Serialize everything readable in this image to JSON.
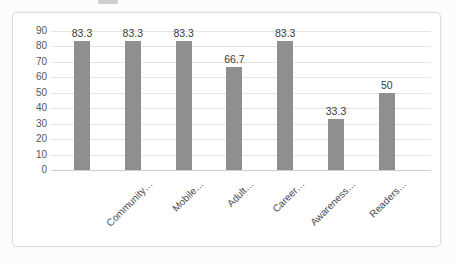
{
  "chart_data": {
    "type": "bar",
    "title": "",
    "xlabel": "",
    "ylabel": "",
    "categories": [
      "",
      "Community…",
      "Mobile…",
      "Adult…",
      "Career…",
      "Awareness…",
      "Readers…"
    ],
    "values": [
      83.3,
      83.3,
      83.3,
      66.7,
      83.3,
      33.3,
      50
    ],
    "data_labels": [
      "83.3",
      "83.3",
      "83.3",
      "66.7",
      "83.3",
      "33.3",
      "50"
    ],
    "ylim": [
      0,
      90
    ],
    "ytick_step": 10,
    "ytick_labels": [
      "0",
      "10",
      "20",
      "30",
      "40",
      "50",
      "60",
      "70",
      "80",
      "90"
    ],
    "grid": true,
    "legend": false,
    "series_name": "",
    "bar_color": "#8f8f8f",
    "gridline_color": "#e5e5e2",
    "axis_text_color": "#565656",
    "data_label_color": "#3c3c3c",
    "chart_background": "#ffffff",
    "chart_border_color": "#dcdbd8"
  }
}
